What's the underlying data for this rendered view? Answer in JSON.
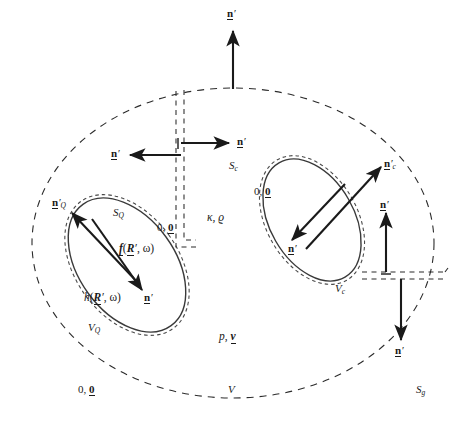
{
  "figure": {
    "name": "scattering-geometry-diagram",
    "width": 463,
    "height": 432,
    "background": "#ffffff",
    "line_color": "#1a1a1a",
    "dash_color": "#2b2b2b"
  },
  "labels": {
    "n_top": "n",
    "n_left": "n",
    "n_right": "n",
    "n_Q_outward": "n",
    "n_Q_inward": "n",
    "n_c_outward": "n",
    "n_c_inward": "n",
    "n_up_right": "n",
    "n_down_right": "n",
    "prime": "′",
    "sub_Q": "Q",
    "sub_c": "c",
    "sub_g": "g",
    "S_Q": "S",
    "S_c": "S",
    "S_g": "S",
    "V_Q": "V",
    "V_c": "V",
    "V": "V",
    "zero_pair_left": "0, 0",
    "zero_pair_Q": "0, 0",
    "zero_pair_c": "0, 0",
    "kappa_rho": "κ, ϱ",
    "f_src": "f(R′, ω)",
    "h_src": "h(R′, ω)",
    "p_v": "p, v",
    "f_head": "f",
    "f_args": "(",
    "R_bold": "R",
    "omega": "ω",
    "h_head": "h",
    "p_italic": "p",
    "v_bold": "v",
    "zero_bold": "0",
    "zero_plain": "0,"
  },
  "regions": [
    {
      "id": "outer-medium",
      "name": "outer-boundary-Sg",
      "label": "S",
      "sublabel": "g",
      "style": "dashed-ellipse"
    },
    {
      "id": "interior-V",
      "name": "interior-volume-V",
      "label": "V",
      "style": "text"
    },
    {
      "id": "inclusion-Q",
      "name": "inclusion-VQ",
      "label": "V",
      "sublabel": "Q",
      "style": "solid-dashed-ellipse"
    },
    {
      "id": "inclusion-c",
      "name": "inclusion-Vc",
      "label": "V",
      "sublabel": "c",
      "style": "solid-dashed-ellipse"
    },
    {
      "id": "slit-left",
      "name": "vertical-cut-slit",
      "style": "dashed-channel"
    },
    {
      "id": "slit-right",
      "name": "horizontal-cut-slit",
      "style": "dashed-channel"
    }
  ],
  "arrows": [
    {
      "id": "a1",
      "name": "normal-arrow-top",
      "label_ref": "n_top",
      "dir": "up"
    },
    {
      "id": "a2",
      "name": "normal-arrow-slit-left",
      "label_ref": "n_left",
      "dir": "left"
    },
    {
      "id": "a3",
      "name": "normal-arrow-slit-right",
      "label_ref": "n_right",
      "dir": "right"
    },
    {
      "id": "a4",
      "name": "normal-arrow-Q-outward",
      "label_ref": "n_Q_outward",
      "dir": "up-left"
    },
    {
      "id": "a5",
      "name": "normal-arrow-Q-inward",
      "label_ref": "n_Q_inward",
      "dir": "down-right"
    },
    {
      "id": "a6",
      "name": "normal-arrow-c-outward",
      "label_ref": "n_c_outward",
      "dir": "up-right"
    },
    {
      "id": "a7",
      "name": "normal-arrow-c-inward",
      "label_ref": "n_c_inward",
      "dir": "down-left"
    },
    {
      "id": "a8",
      "name": "normal-arrow-channel-up",
      "label_ref": "n_up_right",
      "dir": "up"
    },
    {
      "id": "a9",
      "name": "normal-arrow-channel-down",
      "label_ref": "n_down_right",
      "dir": "down"
    }
  ]
}
